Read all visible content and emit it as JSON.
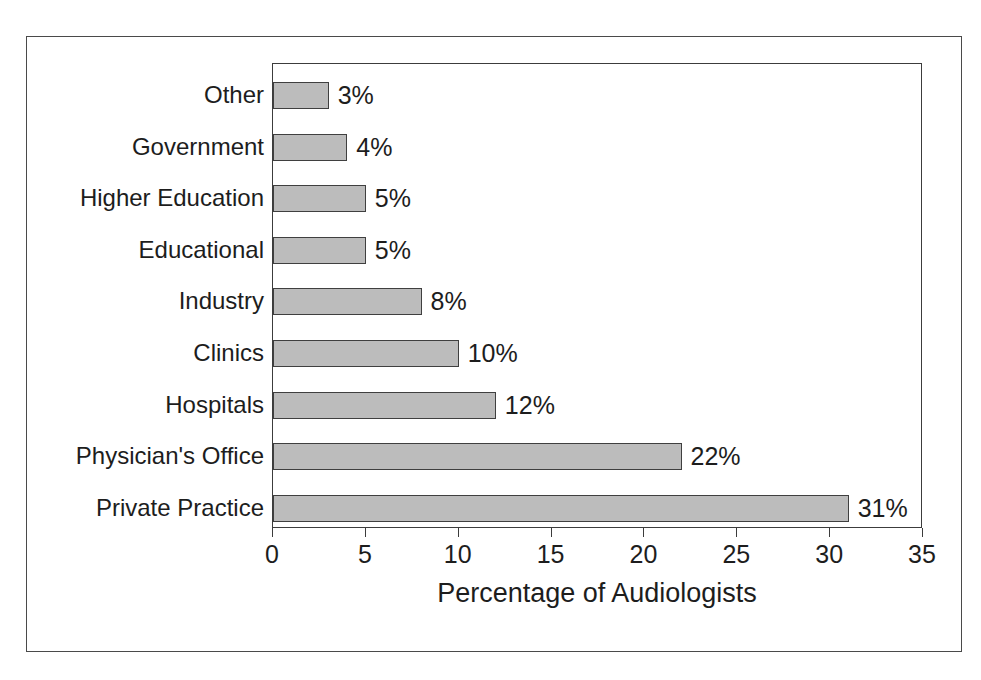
{
  "chart_data": {
    "type": "bar",
    "orientation": "horizontal",
    "title": "",
    "xlabel": "Percentage of Audiologists",
    "ylabel": "",
    "xlim": [
      0,
      35
    ],
    "xticks": [
      "0",
      "5",
      "10",
      "15",
      "20",
      "25",
      "30",
      "35"
    ],
    "grid": false,
    "legend": null,
    "bar_fill_color": "#bcbcbc",
    "bar_border_color": "#3f3f3f",
    "categories": [
      "Other",
      "Government",
      "Higher Education",
      "Educational",
      "Industry",
      "Clinics",
      "Hospitals",
      "Physician's Office",
      "Private Practice"
    ],
    "values": [
      3,
      4,
      5,
      5,
      8,
      10,
      12,
      22,
      31
    ],
    "data_labels": [
      "3%",
      "4%",
      "5%",
      "5%",
      "8%",
      "10%",
      "12%",
      "22%",
      "31%"
    ]
  }
}
